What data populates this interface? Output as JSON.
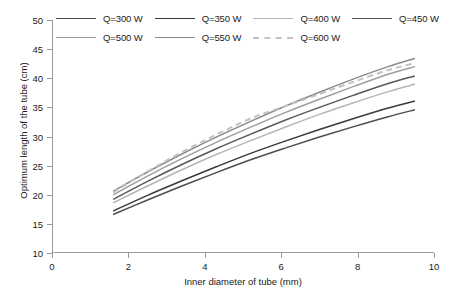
{
  "chart_data": {
    "type": "line",
    "title": "",
    "xlabel": "Inner diameter of tube (mm)",
    "ylabel": "Optimum length of the tube (cm)",
    "xlim": [
      0,
      10
    ],
    "ylim": [
      10,
      50
    ],
    "xticks": [
      0,
      2,
      4,
      6,
      8,
      10
    ],
    "yticks": [
      10,
      15,
      20,
      25,
      30,
      35,
      40,
      45,
      50
    ],
    "grid": false,
    "legend_position": "top",
    "x": [
      1.6,
      2.5,
      3.4,
      4.3,
      5.2,
      6.1,
      7.0,
      7.9,
      8.8,
      9.5
    ],
    "series": [
      {
        "name": "Q=300 W",
        "label": "Q=300 W",
        "color": "#4d4d4d",
        "dash": "none",
        "width": 1.5,
        "values": [
          16.6,
          19.1,
          21.5,
          23.8,
          26.0,
          28.0,
          29.9,
          31.7,
          33.4,
          34.6
        ]
      },
      {
        "name": "Q=350 W",
        "label": "Q=350 W",
        "color": "#3a3a3a",
        "dash": "none",
        "width": 1.5,
        "values": [
          17.2,
          19.9,
          22.4,
          24.8,
          27.1,
          29.2,
          31.2,
          33.1,
          34.9,
          36.1
        ]
      },
      {
        "name": "Q=400 W",
        "label": "Q=400 W",
        "color": "#b5b5b5",
        "dash": "none",
        "width": 1.5,
        "values": [
          18.6,
          21.5,
          24.3,
          26.9,
          29.3,
          31.6,
          33.8,
          35.8,
          37.7,
          39.0
        ]
      },
      {
        "name": "Q=450 W",
        "label": "Q=450 W",
        "color": "#575757",
        "dash": "none",
        "width": 1.5,
        "values": [
          19.2,
          22.3,
          25.2,
          27.9,
          30.4,
          32.8,
          35.0,
          37.1,
          39.1,
          40.4
        ]
      },
      {
        "name": "Q=500 W",
        "label": "Q=500 W",
        "color": "#9e9e9e",
        "dash": "none",
        "width": 1.5,
        "values": [
          20.0,
          23.2,
          26.2,
          29.0,
          31.6,
          34.1,
          36.4,
          38.6,
          40.7,
          42.0
        ]
      },
      {
        "name": "Q=550 W",
        "label": "Q=550 W",
        "color": "#8a8a8a",
        "dash": "none",
        "width": 1.5,
        "values": [
          20.6,
          23.9,
          27.0,
          29.9,
          32.6,
          35.2,
          37.6,
          39.9,
          42.0,
          43.4
        ]
      },
      {
        "name": "Q=600 W",
        "label": "Q=600 W",
        "color": "#c2c2c2",
        "dash": "6,4",
        "width": 2.0,
        "values": [
          20.4,
          24.0,
          27.3,
          30.3,
          33.1,
          35.2,
          37.3,
          39.4,
          41.4,
          42.6
        ]
      }
    ]
  },
  "legend": {
    "rows": [
      [
        "Q=300 W",
        "Q=350 W",
        "Q=400 W",
        "Q=450 W"
      ],
      [
        "Q=500 W",
        "Q=550 W",
        "Q=600 W"
      ]
    ]
  }
}
